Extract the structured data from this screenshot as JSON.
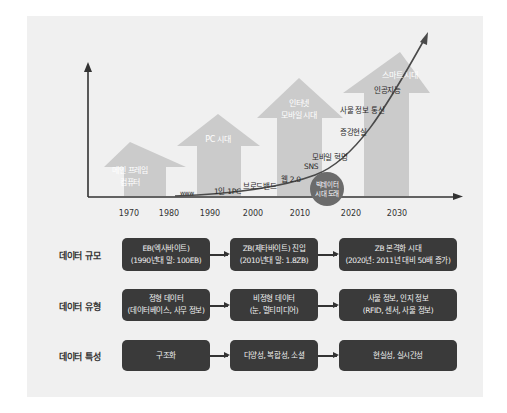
{
  "chart": {
    "x_ticks": [
      "1970",
      "1980",
      "1990",
      "2000",
      "2010",
      "2020",
      "2030"
    ],
    "eras": [
      {
        "line1": "메인 프레임",
        "line2": "컴퓨터"
      },
      {
        "line1": "PC 시대",
        "line2": ""
      },
      {
        "line1": "인터넷",
        "line2": "모바일 시대"
      },
      {
        "line1": "스마트 시대",
        "line2": ""
      }
    ],
    "curve_labels": [
      "www",
      "1인 1PC",
      "브로드밴드",
      "웹 2.0",
      "SNS",
      "모바일 혁명",
      "증강현실",
      "사물 정보 통신",
      "인공지능"
    ],
    "milestone": {
      "line1": "빅데이터",
      "line2": "시대 도래"
    },
    "colors": {
      "axis": "#333333",
      "era_arrow": "#c9c9c9",
      "curve": "#4a4a4a",
      "circle": "#6b6b6b",
      "panel": "#f0f0f0"
    }
  },
  "rows": [
    {
      "label": "데이터 규모",
      "boxes": [
        {
          "line1": "EB(엑사바이트)",
          "line2": "(1990년대 말: 100EB)"
        },
        {
          "line1": "ZB(제타바이트) 진입",
          "line2": "(2010년대 말: 1.8ZB)"
        },
        {
          "line1": "ZB 본격화 시대",
          "line2": "(2020년: 2011년 대비 50배 증가)"
        }
      ]
    },
    {
      "label": "데이터 유형",
      "boxes": [
        {
          "line1": "정형 데이터",
          "line2": "(데이터베이스, 사무 정보)"
        },
        {
          "line1": "비정형 데이터",
          "line2": "(눈, 멀티미디어)"
        },
        {
          "line1": "사물 정보, 인지 정보",
          "line2": "(RFID, 센서, 사물 정보)"
        }
      ]
    },
    {
      "label": "데이터 특성",
      "boxes": [
        {
          "line1": "구조화",
          "line2": ""
        },
        {
          "line1": "다양성, 복합성, 소셜",
          "line2": ""
        },
        {
          "line1": "현실성, 실시간성",
          "line2": ""
        }
      ]
    }
  ]
}
